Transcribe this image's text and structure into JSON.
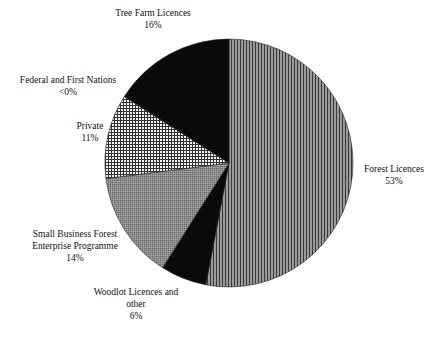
{
  "chart_data": {
    "type": "pie",
    "title": "",
    "start_angle_deg": 0,
    "direction": "clockwise",
    "slices": [
      {
        "label": "Forest Licences",
        "value": 53,
        "display": "53%",
        "pattern": "vertical-stripes"
      },
      {
        "label": "Woodlot Licences and other",
        "value": 6,
        "display": "6%",
        "pattern": "solid-black"
      },
      {
        "label": "Small Business Forest Enterprise Programme",
        "value": 14,
        "display": "14%",
        "pattern": "fine-stipple-gray"
      },
      {
        "label": "Private",
        "value": 11,
        "display": "11%",
        "pattern": "crosshatch"
      },
      {
        "label": "Federal and First Nations",
        "value": 0,
        "display": "<0%",
        "pattern": "none"
      },
      {
        "label": "Tree Farm Licences",
        "value": 16,
        "display": "16%",
        "pattern": "solid-black"
      }
    ]
  },
  "labels": {
    "forest": {
      "line1": "Forest Licences",
      "pct": "53%"
    },
    "woodlot": {
      "line1": "Woodlot Licences and",
      "line2": "other",
      "pct": "6%"
    },
    "sbfep": {
      "line1": "Small Business Forest",
      "line2": "Enterprise Programme",
      "pct": "14%"
    },
    "private": {
      "line1": "Private",
      "pct": "11%"
    },
    "federal": {
      "line1": "Federal and First Nations",
      "pct": "<0%"
    },
    "treefarm": {
      "line1": "Tree Farm Licences",
      "pct": "16%"
    }
  }
}
